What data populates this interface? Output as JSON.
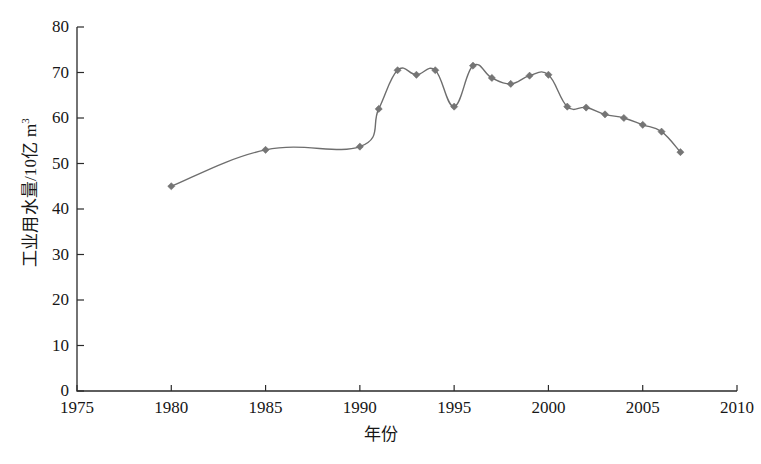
{
  "chart_data": {
    "type": "line",
    "title": "",
    "xlabel": "年份",
    "ylabel": "工业用水量/10亿 m³",
    "ylabel_main": "工业用水量/10",
    "ylabel_unit": "亿 m",
    "ylabel_exponent": "3",
    "xlim": [
      1975,
      2010
    ],
    "ylim": [
      0,
      80
    ],
    "grid": false,
    "legend": null,
    "xticks": [
      1975,
      1980,
      1985,
      1990,
      1995,
      2000,
      2005,
      2010
    ],
    "xtick_labels": [
      "1975",
      "1980",
      "1985",
      "1990",
      "1995",
      "2000",
      "2005",
      "2010"
    ],
    "yticks": [
      0,
      10,
      20,
      30,
      40,
      50,
      60,
      70,
      80
    ],
    "ytick_labels": [
      "0",
      "10",
      "20",
      "30",
      "40",
      "50",
      "60",
      "70",
      "80"
    ],
    "marker": "diamond",
    "marker_color": "#757575",
    "line_color": "#6e6e6e",
    "x": [
      1980,
      1985,
      1990,
      1991,
      1992,
      1993,
      1994,
      1995,
      1996,
      1997,
      1998,
      1999,
      2000,
      2001,
      2002,
      2003,
      2004,
      2005,
      2006,
      2007
    ],
    "values": [
      45.0,
      53.0,
      53.7,
      62.0,
      70.5,
      69.5,
      70.5,
      62.5,
      71.5,
      68.8,
      67.5,
      69.3,
      69.5,
      62.5,
      62.3,
      60.8,
      60.0,
      58.5,
      57.0,
      52.5
    ],
    "series": [
      {
        "name": "工业用水量",
        "values": [
          45.0,
          53.0,
          53.7,
          62.0,
          70.5,
          69.5,
          70.5,
          62.5,
          71.5,
          68.8,
          67.5,
          69.3,
          69.5,
          62.5,
          62.3,
          60.8,
          60.0,
          58.5,
          57.0,
          52.5
        ]
      }
    ]
  },
  "caption": {
    "text": ""
  }
}
